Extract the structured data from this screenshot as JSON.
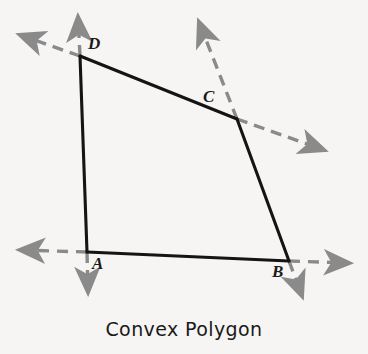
{
  "figure": {
    "caption": "Convex Polygon",
    "background_color": "#f6f5f3",
    "solid_color": "#141414",
    "dashed_color": "#8a8a8a"
  },
  "vertices": [
    {
      "id": "A",
      "label": "A",
      "x": 87,
      "y": 252
    },
    {
      "id": "B",
      "label": "B",
      "x": 289,
      "y": 261
    },
    {
      "id": "C",
      "label": "C",
      "x": 237,
      "y": 119
    },
    {
      "id": "D",
      "label": "D",
      "x": 80,
      "y": 56
    }
  ],
  "polygon": {
    "name": "quadrilateral-ABCD",
    "order": [
      "A",
      "B",
      "C",
      "D"
    ],
    "edges": [
      {
        "name": "edge-AB",
        "from": "A",
        "to": "B"
      },
      {
        "name": "edge-BC",
        "from": "B",
        "to": "C"
      },
      {
        "name": "edge-CD",
        "from": "C",
        "to": "D"
      },
      {
        "name": "edge-DA",
        "from": "D",
        "to": "A"
      }
    ]
  },
  "extension_lines": [
    {
      "name": "extended-line-CD",
      "through": [
        "D",
        "C"
      ],
      "x1": 13,
      "y1": 39,
      "x2": 331,
      "y2": 152,
      "style": "dashed",
      "arrows": "both"
    },
    {
      "name": "extended-line-AB",
      "through": [
        "A",
        "B"
      ],
      "x1": 11,
      "y1": 250,
      "x2": 357,
      "y2": 263,
      "style": "dashed",
      "arrows": "both"
    },
    {
      "name": "extended-line-DA",
      "through": [
        "D",
        "A"
      ],
      "x1": 78,
      "y1": 9,
      "x2": 88,
      "y2": 301,
      "style": "dashed",
      "arrows": "both"
    },
    {
      "name": "extended-line-BC",
      "through": [
        "C",
        "B"
      ],
      "x1": 195,
      "y1": 13,
      "x2": 306,
      "y2": 306,
      "style": "dashed",
      "arrows": "both"
    }
  ]
}
